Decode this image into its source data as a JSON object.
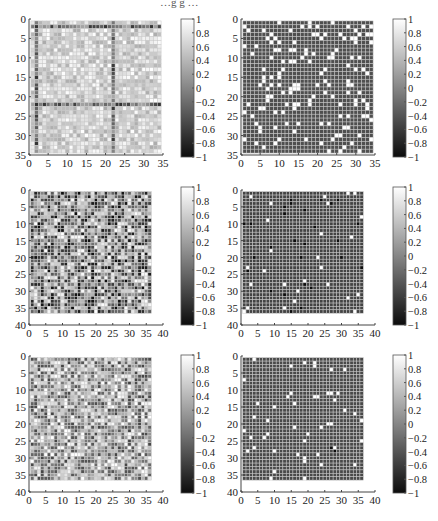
{
  "figure": {
    "width": 438,
    "height": 521,
    "top_clipped_caption": "…g  g  …",
    "grid_line_color": "#c8c8c8",
    "axis_color": "#444444",
    "colormap": "gray",
    "clim": [
      -1,
      1
    ]
  },
  "chart_data": [
    {
      "type": "heatmap",
      "position": "row1-left",
      "title": "",
      "matrix_size": 34,
      "xlim": [
        0,
        35
      ],
      "ylim": [
        0,
        35
      ],
      "x_ticks": [
        0,
        5,
        10,
        15,
        20,
        25,
        30,
        35
      ],
      "y_ticks": [
        0,
        5,
        10,
        15,
        20,
        25,
        30,
        35
      ],
      "y_reversed": true,
      "grid": true,
      "colorbar_ticks": [
        1,
        0.8,
        0.6,
        0.4,
        0.2,
        0,
        -0.2,
        -0.4,
        -0.6,
        -0.8,
        -1
      ],
      "pattern": "mostly light gray/white (0.2–0.9) with dark bands at row 2, row 22, column 2, column 22; scattered dark cells",
      "base_value": 0.65,
      "noise": 0.35,
      "seed": 11,
      "dark_rows": [
        2,
        22
      ],
      "dark_cols": [
        2,
        22
      ],
      "band_value": -0.2
    },
    {
      "type": "heatmap",
      "position": "row1-right",
      "title": "",
      "matrix_size": 34,
      "xlim": [
        0,
        35
      ],
      "ylim": [
        0,
        35
      ],
      "x_ticks": [
        0,
        5,
        10,
        15,
        20,
        25,
        30,
        35
      ],
      "y_ticks": [
        0,
        5,
        10,
        15,
        20,
        25,
        30,
        35
      ],
      "y_reversed": true,
      "grid": true,
      "colorbar_ticks": [
        1,
        0.8,
        0.6,
        0.4,
        0.2,
        0,
        -0.2,
        -0.4,
        -0.6,
        -0.8,
        -1
      ],
      "pattern": "uniform dark gray (~-0.45) background with ~140 sparse white (+1) cells",
      "base_value": -0.45,
      "noise": 0.0,
      "seed": 23,
      "sparse_positive_fraction": 0.11,
      "sparse_negative_fraction": 0.0
    },
    {
      "type": "heatmap",
      "position": "row2-left",
      "title": "",
      "matrix_size": 36,
      "xlim": [
        0,
        40
      ],
      "ylim": [
        0,
        40
      ],
      "x_ticks": [
        0,
        5,
        10,
        15,
        20,
        25,
        30,
        35,
        40
      ],
      "y_ticks": [
        0,
        5,
        10,
        15,
        20,
        25,
        30,
        35,
        40
      ],
      "y_reversed": true,
      "grid": true,
      "colorbar_ticks": [
        1,
        0.8,
        0.6,
        0.4,
        0.2,
        0,
        -0.2,
        -0.4,
        -0.6,
        -0.8,
        -1
      ],
      "pattern": "high-contrast mixed cells spanning the full range -1 to 1, many black clusters",
      "base_value": 0.0,
      "noise": 1.0,
      "seed": 37
    },
    {
      "type": "heatmap",
      "position": "row2-right",
      "title": "",
      "matrix_size": 36,
      "xlim": [
        0,
        40
      ],
      "ylim": [
        0,
        40
      ],
      "x_ticks": [
        0,
        5,
        10,
        15,
        20,
        25,
        30,
        35,
        40
      ],
      "y_ticks": [
        0,
        5,
        10,
        15,
        20,
        25,
        30,
        35,
        40
      ],
      "y_reversed": true,
      "grid": true,
      "colorbar_ticks": [
        1,
        0.8,
        0.6,
        0.4,
        0.2,
        0,
        -0.2,
        -0.4,
        -0.6,
        -0.8,
        -1
      ],
      "pattern": "uniform dark gray (~-0.55) background with ~30 black (-1) cells and ~25 light (+0.8) cells",
      "base_value": -0.55,
      "noise": 0.0,
      "seed": 41,
      "sparse_positive_fraction": 0.02,
      "sparse_negative_fraction": 0.025
    },
    {
      "type": "heatmap",
      "position": "row3-left",
      "title": "",
      "matrix_size": 36,
      "xlim": [
        0,
        40
      ],
      "ylim": [
        0,
        40
      ],
      "x_ticks": [
        0,
        5,
        10,
        15,
        20,
        25,
        30,
        35,
        40
      ],
      "y_ticks": [
        0,
        5,
        10,
        15,
        20,
        25,
        30,
        35,
        40
      ],
      "y_reversed": true,
      "grid": true,
      "colorbar_ticks": [
        1,
        0.8,
        0.6,
        0.4,
        0.2,
        0,
        -0.2,
        -0.4,
        -0.6,
        -0.8,
        -1
      ],
      "pattern": "mixed gray cells, slightly lighter than row 2 left, with a light cross at row/col 17",
      "base_value": 0.25,
      "noise": 0.8,
      "seed": 53
    },
    {
      "type": "heatmap",
      "position": "row3-right",
      "title": "",
      "matrix_size": 36,
      "xlim": [
        0,
        40
      ],
      "ylim": [
        0,
        40
      ],
      "x_ticks": [
        0,
        5,
        10,
        15,
        20,
        25,
        30,
        35,
        40
      ],
      "y_ticks": [
        0,
        5,
        10,
        15,
        20,
        25,
        30,
        35,
        40
      ],
      "y_reversed": true,
      "grid": true,
      "colorbar_ticks": [
        1,
        0.8,
        0.6,
        0.4,
        0.2,
        0,
        -0.2,
        -0.4,
        -0.6,
        -0.8,
        -1
      ],
      "pattern": "uniform dark gray (~-0.5) background with ~60 white cells and a black pair near (28,28)",
      "base_value": -0.5,
      "noise": 0.0,
      "seed": 67,
      "sparse_positive_fraction": 0.045,
      "sparse_negative_fraction": 0.0,
      "explicit_negative_cells": [
        [
          27,
          27
        ],
        [
          28,
          28
        ]
      ]
    }
  ],
  "layout": {
    "panels": [
      {
        "axis_x": 29,
        "axis_top": 19,
        "axis_w": 134,
        "axis_h": 136,
        "cb_x": 181,
        "cb_top": 19,
        "cb_w": 13,
        "cb_h": 138
      },
      {
        "axis_x": 241,
        "axis_top": 19,
        "axis_w": 134,
        "axis_h": 136,
        "cb_x": 393,
        "cb_top": 19,
        "cb_w": 13,
        "cb_h": 138
      },
      {
        "axis_x": 29,
        "axis_top": 190,
        "axis_w": 134,
        "axis_h": 135,
        "cb_x": 181,
        "cb_top": 187,
        "cb_w": 13,
        "cb_h": 138
      },
      {
        "axis_x": 241,
        "axis_top": 190,
        "axis_w": 134,
        "axis_h": 135,
        "cb_x": 393,
        "cb_top": 187,
        "cb_w": 13,
        "cb_h": 138
      },
      {
        "axis_x": 29,
        "axis_top": 356,
        "axis_w": 134,
        "axis_h": 136,
        "cb_x": 181,
        "cb_top": 355,
        "cb_w": 13,
        "cb_h": 138
      },
      {
        "axis_x": 241,
        "axis_top": 356,
        "axis_w": 134,
        "axis_h": 136,
        "cb_x": 393,
        "cb_top": 355,
        "cb_w": 13,
        "cb_h": 138
      }
    ]
  }
}
